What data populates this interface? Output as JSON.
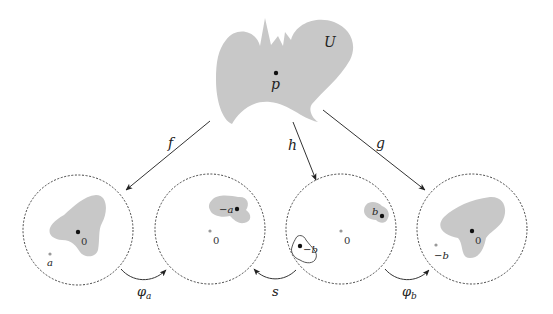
{
  "diagram": {
    "top_region": {
      "label": "U",
      "point_label": "p",
      "fill": "#c8c8c8"
    },
    "maps": [
      {
        "name": "f",
        "label": "f"
      },
      {
        "name": "h",
        "label": "h"
      },
      {
        "name": "g",
        "label": "g"
      }
    ],
    "disks": [
      {
        "id": "disk-1",
        "origin_label": "0",
        "point_label": "a",
        "note": "image of U under f; grey dot a outside region"
      },
      {
        "id": "disk-2",
        "origin_label": "0",
        "point_label": "−a",
        "note": "image after φa; region near −a"
      },
      {
        "id": "disk-3",
        "origin_label": "0",
        "point_labels": [
          "b",
          "−b"
        ],
        "note": "image under h; shaded region at b, outlined region at −b"
      },
      {
        "id": "disk-4",
        "origin_label": "0",
        "point_label": "−b",
        "note": "image after φb"
      }
    ],
    "bottom_maps": [
      {
        "name": "phi-a",
        "label_base": "φ",
        "label_sub": "a",
        "from": "disk-1",
        "to": "disk-2"
      },
      {
        "name": "s",
        "label": "s",
        "from": "disk-3",
        "to": "disk-2"
      },
      {
        "name": "phi-b",
        "label_base": "φ",
        "label_sub": "b",
        "from": "disk-3",
        "to": "disk-4"
      }
    ],
    "colors": {
      "region": "#c8c8c8",
      "stroke": "#333333",
      "origin_dot": "#999999"
    }
  }
}
